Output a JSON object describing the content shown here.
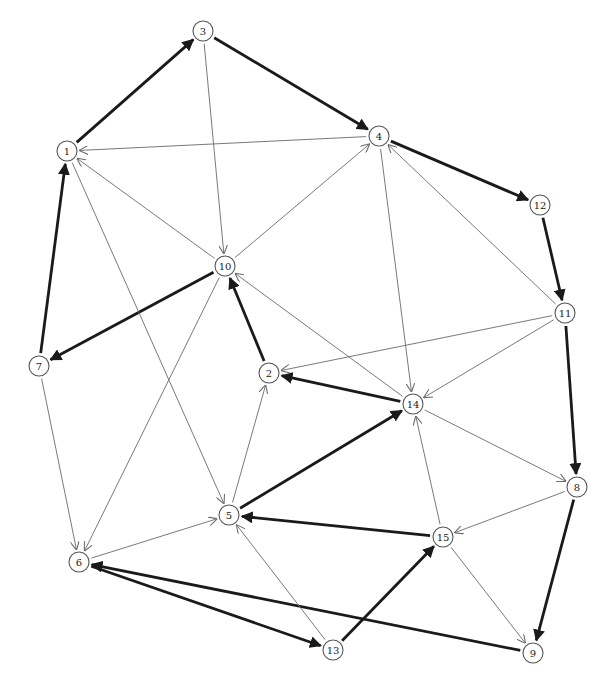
{
  "graph": {
    "directed": true,
    "node_radius": 10,
    "colors": {
      "thin_edge": "#6a6a6a",
      "thick_edge": "#1a1a1a",
      "node_stroke": "#555555",
      "background": "#ffffff"
    },
    "nodes": [
      {
        "id": "1",
        "label": "1",
        "x": 67,
        "y": 151
      },
      {
        "id": "2",
        "label": "2",
        "x": 269,
        "y": 373
      },
      {
        "id": "3",
        "label": "3",
        "x": 203,
        "y": 31
      },
      {
        "id": "4",
        "label": "4",
        "x": 379,
        "y": 136
      },
      {
        "id": "5",
        "label": "5",
        "x": 229,
        "y": 515
      },
      {
        "id": "6",
        "label": "6",
        "x": 79,
        "y": 562
      },
      {
        "id": "7",
        "label": "7",
        "x": 39,
        "y": 366
      },
      {
        "id": "8",
        "label": "8",
        "x": 577,
        "y": 487
      },
      {
        "id": "9",
        "label": "9",
        "x": 533,
        "y": 653
      },
      {
        "id": "10",
        "label": "10",
        "x": 225,
        "y": 266
      },
      {
        "id": "11",
        "label": "11",
        "x": 565,
        "y": 313
      },
      {
        "id": "12",
        "label": "12",
        "x": 540,
        "y": 205
      },
      {
        "id": "13",
        "label": "13",
        "x": 333,
        "y": 650
      },
      {
        "id": "14",
        "label": "14",
        "x": 413,
        "y": 404
      },
      {
        "id": "15",
        "label": "15",
        "x": 443,
        "y": 537
      }
    ],
    "edges": [
      {
        "from": "1",
        "to": "3",
        "weight": "thick"
      },
      {
        "from": "3",
        "to": "4",
        "weight": "thick"
      },
      {
        "from": "4",
        "to": "12",
        "weight": "thick"
      },
      {
        "from": "12",
        "to": "11",
        "weight": "thick"
      },
      {
        "from": "11",
        "to": "8",
        "weight": "thick"
      },
      {
        "from": "8",
        "to": "9",
        "weight": "thick"
      },
      {
        "from": "9",
        "to": "6",
        "weight": "thick"
      },
      {
        "from": "6",
        "to": "13",
        "weight": "thick"
      },
      {
        "from": "13",
        "to": "15",
        "weight": "thick"
      },
      {
        "from": "15",
        "to": "5",
        "weight": "thick"
      },
      {
        "from": "5",
        "to": "14",
        "weight": "thick"
      },
      {
        "from": "14",
        "to": "2",
        "weight": "thick"
      },
      {
        "from": "2",
        "to": "10",
        "weight": "thick"
      },
      {
        "from": "10",
        "to": "7",
        "weight": "thick"
      },
      {
        "from": "7",
        "to": "1",
        "weight": "thick"
      },
      {
        "from": "4",
        "to": "1",
        "weight": "thin"
      },
      {
        "from": "10",
        "to": "1",
        "weight": "thin"
      },
      {
        "from": "1",
        "to": "5",
        "weight": "thin"
      },
      {
        "from": "3",
        "to": "10",
        "weight": "thin"
      },
      {
        "from": "10",
        "to": "4",
        "weight": "thin"
      },
      {
        "from": "4",
        "to": "14",
        "weight": "thin"
      },
      {
        "from": "11",
        "to": "4",
        "weight": "thin"
      },
      {
        "from": "11",
        "to": "2",
        "weight": "thin"
      },
      {
        "from": "11",
        "to": "14",
        "weight": "thin"
      },
      {
        "from": "14",
        "to": "10",
        "weight": "thin"
      },
      {
        "from": "10",
        "to": "6",
        "weight": "thin"
      },
      {
        "from": "7",
        "to": "6",
        "weight": "thin"
      },
      {
        "from": "6",
        "to": "5",
        "weight": "thin"
      },
      {
        "from": "5",
        "to": "2",
        "weight": "thin"
      },
      {
        "from": "13",
        "to": "5",
        "weight": "thin"
      },
      {
        "from": "15",
        "to": "14",
        "weight": "thin"
      },
      {
        "from": "14",
        "to": "8",
        "weight": "thin"
      },
      {
        "from": "8",
        "to": "15",
        "weight": "thin"
      },
      {
        "from": "15",
        "to": "9",
        "weight": "thin"
      }
    ]
  }
}
